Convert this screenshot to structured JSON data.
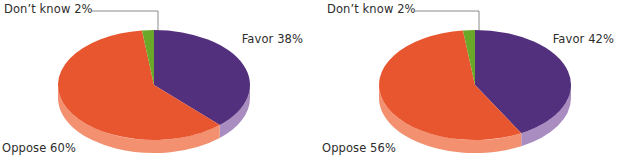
{
  "figure": {
    "background_color": "#ffffff",
    "width": 619,
    "height": 166
  },
  "palette": {
    "favor_top": "#53307D",
    "favor_side": "#A98CC0",
    "oppose_top": "#E8562F",
    "oppose_side": "#F2906F",
    "dontknow_top": "#6AA82A",
    "dontknow_side": "#8CC24A",
    "leader_line": "#7d7d7d",
    "label_text": "#2d2d2d"
  },
  "chart_data": [
    {
      "type": "pie",
      "id": "chart-left",
      "title": "",
      "legend_position": "callout-labels",
      "grid": false,
      "categories": [
        "Favor",
        "Oppose",
        "Don't know"
      ],
      "values": [
        38,
        60,
        2
      ],
      "unit": "%",
      "labels": {
        "favor": "Favor 38%",
        "oppose": "Oppose 60%",
        "dontknow": "Don’t know 2%"
      },
      "colors": [
        "#53307D",
        "#E8562F",
        "#6AA82A"
      ],
      "start_angle_deg": 0,
      "direction": "clockwise",
      "three_d": true
    },
    {
      "type": "pie",
      "id": "chart-right",
      "title": "",
      "legend_position": "callout-labels",
      "grid": false,
      "categories": [
        "Favor",
        "Oppose",
        "Don't know"
      ],
      "values": [
        42,
        56,
        2
      ],
      "unit": "%",
      "labels": {
        "favor": "Favor 42%",
        "oppose": "Oppose 56%",
        "dontknow": "Don’t know 2%"
      },
      "colors": [
        "#53307D",
        "#E8562F",
        "#6AA82A"
      ],
      "start_angle_deg": 0,
      "direction": "clockwise",
      "three_d": true
    }
  ]
}
